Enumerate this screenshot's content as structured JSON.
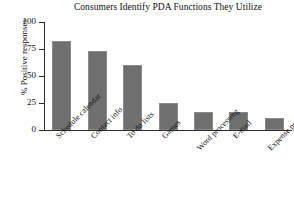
{
  "chart_data": {
    "type": "bar",
    "title": "Consumers Identify PDA Functions They Utilize",
    "xlabel": "",
    "ylabel": "% Positive responses",
    "categories": [
      "Schedule calendar",
      "Contact info",
      "To do lists",
      "Games",
      "Word processing",
      "E-mail",
      "Expense programs"
    ],
    "values": [
      82,
      73,
      60,
      25,
      17,
      17,
      11
    ],
    "ylim": [
      0,
      100
    ],
    "yticks": [
      "0",
      "25",
      "50",
      "75",
      "100"
    ],
    "ytick_values": [
      0,
      25,
      50,
      75,
      100
    ],
    "grid": false,
    "legend": "none",
    "bar_color": "#6f6f6f",
    "axis_color": "#2b2b2b",
    "background": "#ffffff",
    "label_rotation": -45
  }
}
